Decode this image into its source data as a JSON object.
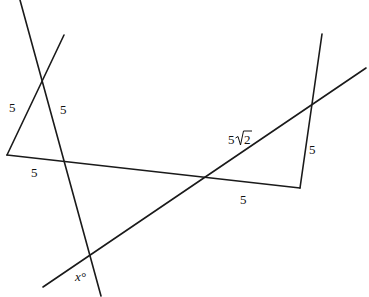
{
  "diagram": {
    "type": "geometry",
    "stroke_color": "#1a1a1a",
    "lines": [
      {
        "id": "long-left-transversal",
        "from": [
          20,
          0
        ],
        "to": [
          101,
          296
        ]
      },
      {
        "id": "short-left-segment",
        "from": [
          64,
          35
        ],
        "to": [
          7,
          155
        ]
      },
      {
        "id": "bottom-segment",
        "from": [
          7,
          155
        ],
        "to": [
          300,
          188
        ]
      },
      {
        "id": "right-steep-segment",
        "from": [
          300,
          188
        ],
        "to": [
          322,
          34
        ]
      },
      {
        "id": "long-diagonal",
        "from": [
          43,
          287
        ],
        "to": [
          366,
          68
        ]
      }
    ],
    "labels": [
      {
        "id": "left-side-5",
        "text": "5",
        "x": 9,
        "y": 108
      },
      {
        "id": "mid-side-5",
        "text": "5",
        "x": 60,
        "y": 110
      },
      {
        "id": "bottom-left-5",
        "text": "5",
        "x": 31,
        "y": 173
      },
      {
        "id": "diagonal-5-root-2",
        "text": "5",
        "x": 228,
        "y": 140,
        "radical": "2"
      },
      {
        "id": "right-side-5",
        "text": "5",
        "x": 309,
        "y": 150
      },
      {
        "id": "bottom-right-5",
        "text": "5",
        "x": 240,
        "y": 200
      },
      {
        "id": "angle-x",
        "text": "x°",
        "x": 75,
        "y": 277
      }
    ]
  }
}
